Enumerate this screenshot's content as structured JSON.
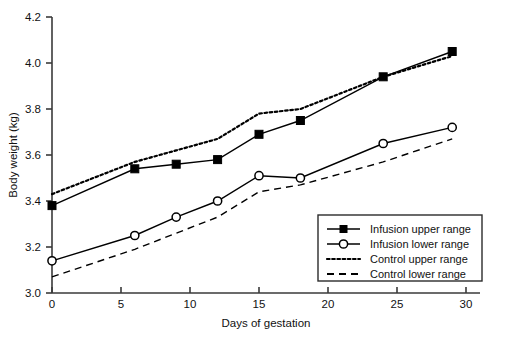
{
  "chart_data": {
    "type": "line",
    "title": "",
    "xlabel": "Days of gestation",
    "ylabel": "Body weight (kg)",
    "xlim": [
      0,
      30
    ],
    "ylim": [
      3.0,
      4.2
    ],
    "xticks": [
      "0",
      "5",
      "10",
      "15",
      "20",
      "25",
      "30"
    ],
    "xtick_values": [
      0,
      5,
      10,
      15,
      20,
      25,
      30
    ],
    "yticks": [
      "3.0",
      "3.2",
      "3.4",
      "3.6",
      "3.8",
      "4.0",
      "4.2"
    ],
    "ytick_values": [
      3.0,
      3.2,
      3.4,
      3.6,
      3.8,
      4.0,
      4.2
    ],
    "grid": false,
    "legend_position": "bottom-right",
    "series": [
      {
        "name": "Infusion upper range",
        "marker": "filled-square",
        "linestyle": "solid",
        "color": "#000000",
        "x": [
          0,
          6,
          9,
          12,
          15,
          18,
          24,
          29
        ],
        "values": [
          3.38,
          3.54,
          3.56,
          3.58,
          3.69,
          3.75,
          3.94,
          4.05
        ]
      },
      {
        "name": "Infusion lower range",
        "marker": "open-circle",
        "linestyle": "solid",
        "color": "#000000",
        "x": [
          0,
          6,
          9,
          12,
          15,
          18,
          24,
          29
        ],
        "values": [
          3.14,
          3.25,
          3.33,
          3.4,
          3.51,
          3.5,
          3.65,
          3.72
        ]
      },
      {
        "name": "Control upper range",
        "marker": "none",
        "linestyle": "dotted",
        "color": "#000000",
        "x": [
          0,
          6,
          9,
          12,
          15,
          18,
          21,
          24,
          29
        ],
        "values": [
          3.43,
          3.57,
          3.62,
          3.67,
          3.78,
          3.8,
          3.87,
          3.94,
          4.03
        ]
      },
      {
        "name": "Control lower range",
        "marker": "none",
        "linestyle": "dashed",
        "color": "#000000",
        "x": [
          0,
          6,
          9,
          12,
          15,
          18,
          24,
          29
        ],
        "values": [
          3.07,
          3.19,
          3.26,
          3.33,
          3.44,
          3.47,
          3.57,
          3.67
        ]
      }
    ]
  },
  "legend": {
    "items": [
      {
        "label": "Infusion upper range",
        "marker": "filled-square",
        "linestyle": "solid"
      },
      {
        "label": "Infusion lower range",
        "marker": "open-circle",
        "linestyle": "solid"
      },
      {
        "label": "Control upper range",
        "marker": "none",
        "linestyle": "dotted"
      },
      {
        "label": "Control lower range",
        "marker": "none",
        "linestyle": "dashed"
      }
    ]
  }
}
